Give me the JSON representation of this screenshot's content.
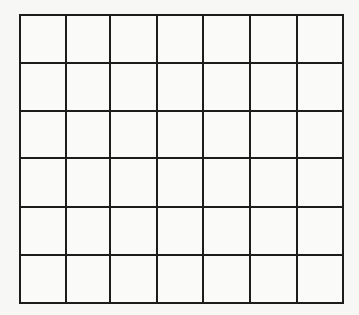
{
  "diagram": {
    "type": "empty-grid",
    "columns": 7,
    "rows": 6,
    "cells_filled": [],
    "colors": {
      "background": "#f7f7f5",
      "cell_fill": "#fafaf8",
      "line": "#1c1c1c"
    },
    "vertical_lines_x": [
      20,
      66,
      110,
      157,
      203,
      250,
      297,
      343
    ],
    "horizontal_lines_y": [
      15,
      63,
      111,
      158,
      207,
      255,
      303
    ]
  }
}
